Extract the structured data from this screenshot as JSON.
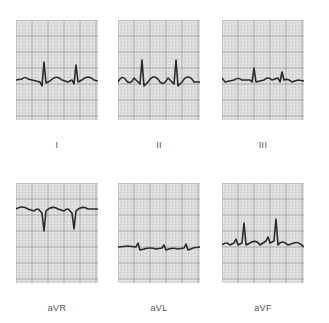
{
  "figure": {
    "title": "",
    "colors": {
      "grid_minor": "#c8c8c8",
      "grid_major": "#8f8f8f",
      "paper": "#e4e4e4",
      "trace": "#2a2a2a",
      "label": "#555555"
    },
    "leads": [
      {
        "label": "I",
        "x": 16,
        "y": 20,
        "label_y": 140,
        "trace": "M0,60 L6,59 Q9,56 12,59 L20,61 L24,62 L26,66 L28,42 L30,63 L34,61 Q40,54 46,60 L52,62 L56,60 L58,64 L60,45 L62,62 L66,60 Q72,54 78,60 L82,61"
      },
      {
        "label": "II",
        "x": 118,
        "y": 20,
        "label_y": 140,
        "trace": "M0,62 Q4,54 8,60 Q12,66 16,58 L20,62 L22,64 L24,40 L26,66 L30,62 Q36,52 42,62 Q46,66 50,58 L54,62 L56,64 L58,40 L60,66 L64,62 Q70,52 76,62 L82,62"
      },
      {
        "label": "III",
        "x": 222,
        "y": 20,
        "label_y": 140,
        "trace": "M0,58 L3,62 L12,60 Q16,57 20,60 L28,60 L30,62 L32,48 L34,62 L42,60 Q46,56 50,60 L56,58 L58,62 L60,52 L62,60 Q66,58 70,62 L76,60 L82,61"
      },
      {
        "label": "aVR",
        "x": 16,
        "y": 183,
        "label_y": 303,
        "trace": "M0,26 Q6,22 12,26 L18,28 Q22,24 24,28 L26,30 L28,48 L30,28 Q36,22 42,26 L48,28 Q52,24 54,28 L56,30 L58,46 L60,28 Q66,22 72,26 L82,26"
      },
      {
        "label": "aVL",
        "x": 118,
        "y": 183,
        "label_y": 303,
        "trace": "M0,64 L10,63 L18,64 L20,60 L22,67 L26,66 Q32,64 38,66 L44,65 L46,62 L48,67 Q54,64 60,66 L66,65 L68,61 L70,67 Q76,64 82,64"
      },
      {
        "label": "aVF",
        "x": 222,
        "y": 183,
        "label_y": 303,
        "trace": "M0,62 Q4,58 8,62 L12,60 L14,56 L16,62 L20,60 L22,40 L24,62 L28,60 Q34,56 38,62 L44,58 L46,54 L48,60 L52,58 L54,36 L56,62 Q60,56 66,62 L72,60 Q76,58 82,64"
      }
    ]
  }
}
